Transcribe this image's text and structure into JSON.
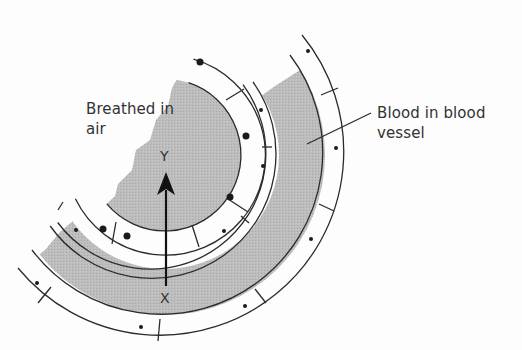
{
  "diagram": {
    "labels": {
      "air_line1": "Breathed in",
      "air_line2": "air",
      "blood_line1": "Blood in blood",
      "blood_line2": "vessel",
      "axis_top": "Y",
      "axis_bottom": "X"
    },
    "colors": {
      "gray_fill": "#b9b9b9",
      "stroke": "#2b2b2b",
      "background": "#fdfdfd"
    },
    "regions": [
      {
        "name": "breathed-in-air",
        "fill": "gray"
      },
      {
        "name": "alveolar-wall",
        "fill": "white",
        "dots": "large"
      },
      {
        "name": "capillary-wall",
        "fill": "white",
        "dots": "small"
      },
      {
        "name": "blood-in-blood-vessel",
        "fill": "gray"
      },
      {
        "name": "outer-wall",
        "fill": "white",
        "dots": "small"
      }
    ],
    "arrow": {
      "from": "X",
      "to": "Y",
      "direction": "up"
    }
  }
}
